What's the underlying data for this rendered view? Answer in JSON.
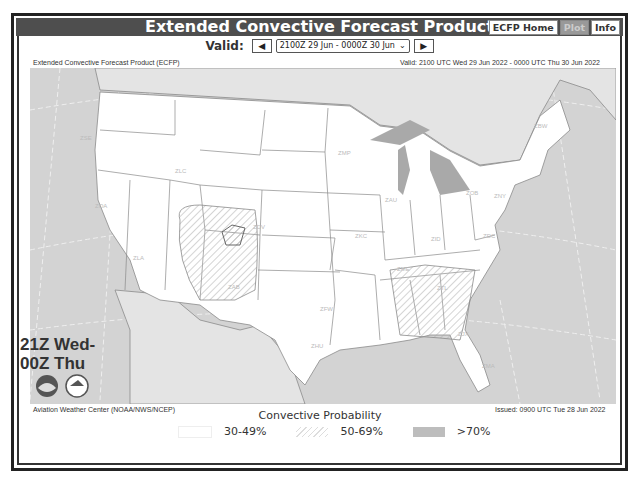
{
  "header": {
    "title": "Extended Convective Forecast Product",
    "nav": [
      {
        "label": "ECFP Home",
        "active": false
      },
      {
        "label": "Plot",
        "active": true
      },
      {
        "label": "Info",
        "active": false
      }
    ]
  },
  "valid_selector": {
    "label": "Valid:",
    "prev_icon": "left-arrow-icon",
    "selected": "2100Z 29 Jun - 0000Z 30 Jun",
    "next_icon": "right-arrow-icon"
  },
  "map": {
    "product_name": "Extended Convective Forecast Product (ECFP)",
    "valid_text": "Valid: 2100 UTC Wed 29 Jun 2022 - 0000 UTC Thu 30 Jun 2022",
    "time_label_line1": "21Z Wed-",
    "time_label_line2": "00Z Thu",
    "source": "Aviation Weather Center (NOAA/NWS/NCEP)",
    "issued": "Issued: 0900 UTC Tue 28 Jun 2022",
    "artcc_labels": [
      {
        "id": "ZSE",
        "x": 80,
        "y": 140
      },
      {
        "id": "ZLC",
        "x": 175,
        "y": 173
      },
      {
        "id": "ZOA",
        "x": 95,
        "y": 208
      },
      {
        "id": "ZLA",
        "x": 133,
        "y": 260
      },
      {
        "id": "ZDV",
        "x": 253,
        "y": 229
      },
      {
        "id": "ZAB",
        "x": 228,
        "y": 289
      },
      {
        "id": "ZMP",
        "x": 338,
        "y": 155
      },
      {
        "id": "ZAU",
        "x": 385,
        "y": 202
      },
      {
        "id": "ZKC",
        "x": 355,
        "y": 238
      },
      {
        "id": "ZFW",
        "x": 320,
        "y": 311
      },
      {
        "id": "ZHU",
        "x": 311,
        "y": 348
      },
      {
        "id": "ZME",
        "x": 397,
        "y": 271
      },
      {
        "id": "ZID",
        "x": 431,
        "y": 241
      },
      {
        "id": "ZOB",
        "x": 466,
        "y": 195
      },
      {
        "id": "ZNY",
        "x": 494,
        "y": 198
      },
      {
        "id": "ZBW",
        "x": 534,
        "y": 128
      },
      {
        "id": "ZDC",
        "x": 483,
        "y": 238
      },
      {
        "id": "ZTL",
        "x": 437,
        "y": 290
      },
      {
        "id": "ZJX",
        "x": 458,
        "y": 336
      },
      {
        "id": "ZMA",
        "x": 482,
        "y": 368
      }
    ]
  },
  "legend": {
    "title": "Convective Probability",
    "items": [
      {
        "label": "30-49%",
        "pattern": "white"
      },
      {
        "label": "50-69%",
        "pattern": "hatched"
      },
      {
        "label": ">70%",
        "pattern": "gray"
      }
    ]
  },
  "colors": {
    "header_bg": "#4e4e4e",
    "ocean": "#d3d3d3",
    "land_us": "#ffffff",
    "land_other": "#e4e4e4",
    "lakes": "#a9a9a9",
    "borders": "#8a8a8a"
  }
}
